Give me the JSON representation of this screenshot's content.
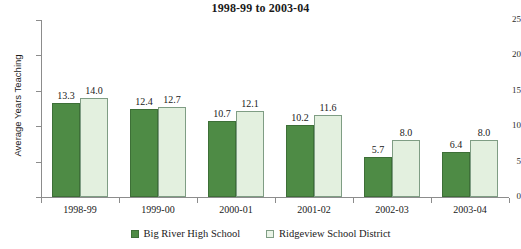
{
  "chart_data": {
    "type": "bar",
    "title": "1998-99 to 2003-04",
    "xlabel": "",
    "ylabel": "Average Years Teaching",
    "categories": [
      "1998-99",
      "1999-00",
      "2000-01",
      "2001-02",
      "2002-03",
      "2003-04"
    ],
    "series": [
      {
        "name": "Big River High School",
        "color": "#4e8b45",
        "values": [
          13.3,
          12.4,
          10.7,
          10.2,
          5.7,
          6.4
        ]
      },
      {
        "name": "Ridgeview School District",
        "color": "#e3f0df",
        "values": [
          14.0,
          12.7,
          12.1,
          11.6,
          8.0,
          8.0
        ]
      }
    ],
    "value_labels": [
      [
        "13.3",
        "12.4",
        "10.7",
        "10.2",
        "5.7",
        "6.4"
      ],
      [
        "14.0",
        "12.7",
        "12.1",
        "11.6",
        "8.0",
        "8.0"
      ]
    ],
    "ylim": [
      0,
      25
    ],
    "yticks": [
      0,
      5,
      10,
      15,
      20,
      25
    ],
    "ytick_labels": [
      "0",
      "5",
      "10",
      "15",
      "20",
      "25"
    ],
    "grid": false,
    "legend_position": "bottom"
  }
}
